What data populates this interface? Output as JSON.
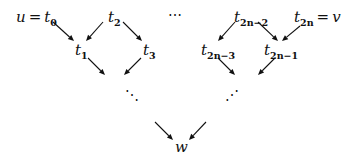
{
  "diagram": {
    "type": "directed-graph",
    "nodes": {
      "t0": {
        "base": "u = t",
        "sub": "0"
      },
      "t1": {
        "base": "t",
        "sub": "1"
      },
      "t2": {
        "base": "t",
        "sub": "2"
      },
      "t3": {
        "base": "t",
        "sub": "3"
      },
      "t2n2": {
        "base": "t",
        "sub": "2n−2"
      },
      "t2n3": {
        "base": "t",
        "sub": "2n−3"
      },
      "t2n1": {
        "base": "t",
        "sub": "2n−1"
      },
      "t2n": {
        "base": "t",
        "sub": "2n",
        "suffix": " = v"
      },
      "w": {
        "base": "w"
      }
    },
    "ellipsis_top": "⋯",
    "ellipsis_left": "⋱",
    "ellipsis_right": "⋰",
    "edges": [
      {
        "from": "t0",
        "to": "t1"
      },
      {
        "from": "t2",
        "to": "t1"
      },
      {
        "from": "t2",
        "to": "t3"
      },
      {
        "from": "t1",
        "to": "ellipsis_left"
      },
      {
        "from": "t3",
        "to": "ellipsis_left"
      },
      {
        "from": "t2n2",
        "to": "t2n3"
      },
      {
        "from": "t2n2",
        "to": "t2n1"
      },
      {
        "from": "t2n",
        "to": "t2n1"
      },
      {
        "from": "t2n3",
        "to": "ellipsis_right"
      },
      {
        "from": "t2n1",
        "to": "ellipsis_right"
      },
      {
        "from": "ellipsis_left",
        "to": "w"
      },
      {
        "from": "ellipsis_right",
        "to": "w"
      }
    ]
  }
}
